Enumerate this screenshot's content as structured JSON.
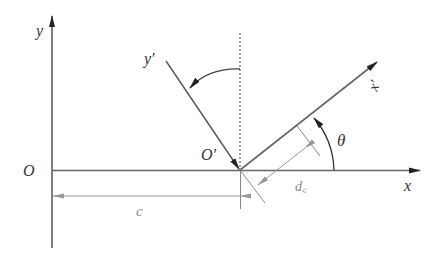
{
  "diagram": {
    "labels": {
      "y_axis": "y",
      "x_axis": "x",
      "origin": "O",
      "origin_prime": "O′",
      "y_prime_axis": "y′",
      "x_prime_axis": "x′",
      "theta": "θ",
      "c_dimension": "c",
      "dc_dimension": "d꜀"
    },
    "colors": {
      "axis": "#555555",
      "dimension": "#999999",
      "dashed": "#444444",
      "background": "#ffffff"
    }
  }
}
